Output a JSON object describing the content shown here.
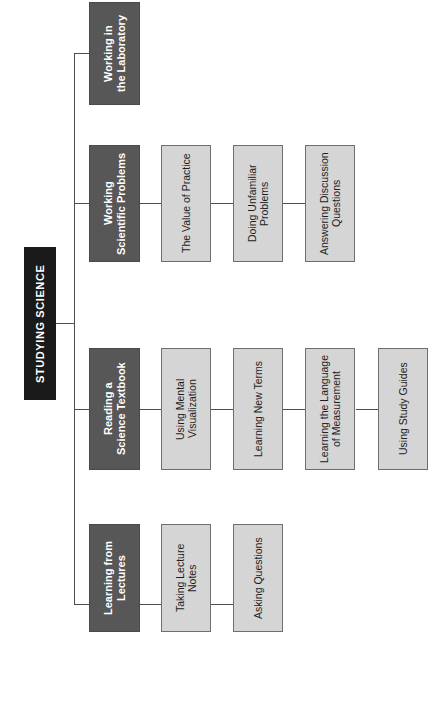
{
  "diagram": {
    "type": "tree",
    "orientation": "rotated-90-counterclockwise",
    "root": {
      "label": "STUDYING SCIENCE",
      "style": "black",
      "color": "#1a1a1a"
    },
    "colors": {
      "root_fill": "#1a1a1a",
      "root_text": "#ffffff",
      "branch_fill": "#575757",
      "branch_text": "#ffffff",
      "leaf_fill": "#d5d5d5",
      "leaf_text": "#1d1d1d",
      "line": "#4d4d4d",
      "background": "#ffffff"
    },
    "branches": [
      {
        "label": "Working in\nthe Laboratory",
        "line1": "Working in",
        "line2": "the Laboratory",
        "children": []
      },
      {
        "label": "Working\nScientific Problems",
        "line1": "Working",
        "line2": "Scientific Problems",
        "children": [
          {
            "label": "The Value of Practice",
            "line1": "The Value of Practice",
            "line2": ""
          },
          {
            "label": "Doing Unfamiliar Problems",
            "line1": "Doing Unfamiliar",
            "line2": "Problems"
          },
          {
            "label": "Answering Discussion Questions",
            "line1": "Answering Discussion",
            "line2": "Questions"
          }
        ]
      },
      {
        "label": "Reading a\nScience Textbook",
        "line1": "Reading a",
        "line2": "Science Textbook",
        "children": [
          {
            "label": "Using Mental Visualization",
            "line1": "Using Mental",
            "line2": "Visualization"
          },
          {
            "label": "Learning New Terms",
            "line1": "Learning New Terms",
            "line2": ""
          },
          {
            "label": "Learning the Language of Measurement",
            "line1": "Learning the Language",
            "line2": "of Measurement"
          },
          {
            "label": "Using Study Guides",
            "line1": "Using Study Guides",
            "line2": ""
          }
        ]
      },
      {
        "label": "Learning from\nLectures",
        "line1": "Learning from",
        "line2": "Lectures",
        "children": [
          {
            "label": "Taking Lecture Notes",
            "line1": "Taking Lecture",
            "line2": "Notes"
          },
          {
            "label": "Asking Questions",
            "line1": "Asking Questions",
            "line2": ""
          }
        ]
      }
    ]
  }
}
